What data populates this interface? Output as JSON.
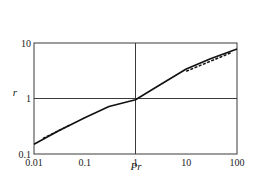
{
  "chart_data": {
    "type": "line",
    "title": "",
    "xlabel": "Pr",
    "ylabel": "r",
    "xscale": "log",
    "yscale": "log",
    "xlim": [
      0.01,
      100
    ],
    "ylim": [
      0.1,
      10
    ],
    "x_ticks": [
      0.01,
      0.1,
      1,
      10,
      100
    ],
    "x_tick_labels": [
      "0.01",
      "0.1",
      "1",
      "10",
      "100"
    ],
    "y_ticks": [
      0.1,
      1,
      10
    ],
    "y_tick_labels": [
      "0.1",
      "1",
      "10"
    ],
    "grid": {
      "on": true,
      "lines": [
        {
          "axis": "x",
          "value": 1
        },
        {
          "axis": "y",
          "value": 1
        }
      ]
    },
    "legend": null,
    "series": [
      {
        "name": "solid curve",
        "style": "solid",
        "x": [
          0.01,
          0.03,
          0.1,
          0.3,
          1,
          3,
          10,
          30,
          100
        ],
        "y": [
          0.15,
          0.26,
          0.45,
          0.72,
          0.95,
          1.75,
          3.4,
          5.2,
          7.8
        ]
      },
      {
        "name": "dashed low-Pr asymptote",
        "style": "dashed",
        "x": [
          0.015,
          0.05
        ],
        "y": [
          0.19,
          0.33
        ]
      },
      {
        "name": "dashed high-Pr asymptote",
        "style": "dashed",
        "x": [
          10,
          80
        ],
        "y": [
          3.1,
          6.8
        ]
      }
    ]
  },
  "labels": {
    "xlabel": "Pr",
    "ylabel": "r"
  }
}
